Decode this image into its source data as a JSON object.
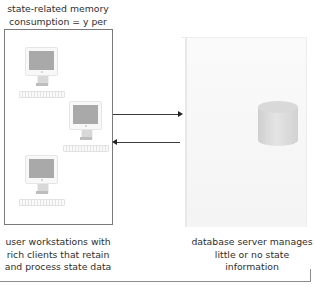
{
  "diagram": {
    "top_caption": "state-related memory consumption = y per client",
    "client_caption": "user workstations with rich clients that retain and process state data",
    "server_caption": "database server manages little or no state information",
    "clients": [
      {
        "name": "workstation-1"
      },
      {
        "name": "workstation-2"
      },
      {
        "name": "workstation-3"
      }
    ],
    "arrows": [
      {
        "direction": "client-to-server"
      },
      {
        "direction": "server-to-client"
      }
    ],
    "server_icon": "database-cylinder-icon",
    "colors": {
      "box_border": "#7a7a7a",
      "screen": "#a9a9a9",
      "arrow": "#3a3a3a",
      "server_bg": "#f6f6f6"
    }
  }
}
